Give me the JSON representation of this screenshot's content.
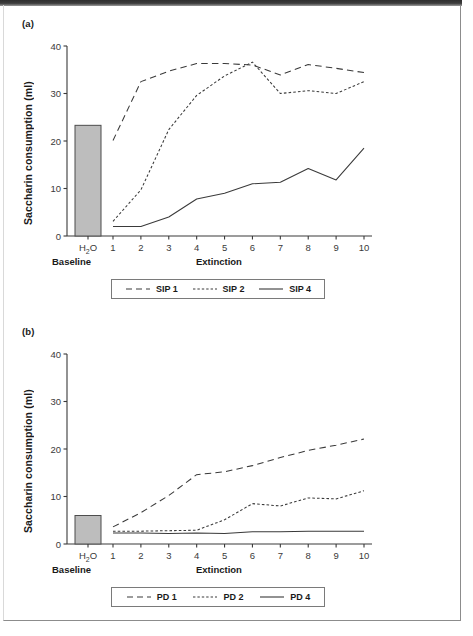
{
  "figure": {
    "panels": [
      {
        "tag": "(a)",
        "ylabel": "Saccharin consumption (ml)",
        "baseline_group_label": "Baseline",
        "extinction_group_label": "Extinction",
        "baseline_tick_label": "H2O",
        "legend": [
          {
            "label": "SIP 1",
            "style": "long-dash"
          },
          {
            "label": "SIP 2",
            "style": "short-dash"
          },
          {
            "label": "SIP 4",
            "style": "solid"
          }
        ]
      },
      {
        "tag": "(b)",
        "ylabel": "Saccharin consumption (ml)",
        "baseline_group_label": "Baseline",
        "extinction_group_label": "Extinction",
        "baseline_tick_label": "H2O",
        "legend": [
          {
            "label": "PD 1",
            "style": "long-dash"
          },
          {
            "label": "PD 2",
            "style": "short-dash"
          },
          {
            "label": "PD 4",
            "style": "solid"
          }
        ]
      }
    ]
  },
  "chart_data": [
    {
      "type": "line",
      "panel": "(a)",
      "title": "",
      "xlabel": "Extinction",
      "ylabel": "Saccharin consumption (ml)",
      "ylim": [
        0,
        40
      ],
      "yticks": [
        0,
        10,
        20,
        30,
        40
      ],
      "ytick_labels": [
        "0",
        "10",
        "20",
        "30",
        "40"
      ],
      "grid": false,
      "legend_position": "below",
      "baseline": {
        "category": "H2O",
        "group_label": "Baseline",
        "value": 23.3,
        "bar_color": "#bdbdbd",
        "bar_edge_color": "#4d4d4d"
      },
      "categories": [
        "1",
        "2",
        "3",
        "4",
        "5",
        "6",
        "7",
        "8",
        "9",
        "10"
      ],
      "x": [
        1,
        2,
        3,
        4,
        5,
        6,
        7,
        8,
        9,
        10
      ],
      "series": [
        {
          "name": "SIP 1",
          "style": "long-dash",
          "values": [
            20.1,
            32.5,
            34.7,
            36.3,
            36.3,
            36.0,
            33.9,
            36.1,
            35.3,
            34.4
          ]
        },
        {
          "name": "SIP 2",
          "style": "short-dash",
          "values": [
            3.1,
            9.7,
            22.4,
            29.6,
            33.7,
            36.6,
            30.0,
            30.6,
            30.0,
            32.5
          ]
        },
        {
          "name": "SIP 4",
          "style": "solid",
          "values": [
            2.0,
            2.0,
            4.0,
            7.8,
            9.0,
            11.0,
            11.3,
            14.2,
            11.8,
            18.5
          ]
        }
      ]
    },
    {
      "type": "line",
      "panel": "(b)",
      "title": "",
      "xlabel": "Extinction",
      "ylabel": "Saccharin consumption (ml)",
      "ylim": [
        0,
        40
      ],
      "yticks": [
        0,
        10,
        20,
        30,
        40
      ],
      "ytick_labels": [
        "0",
        "10",
        "20",
        "30",
        "40"
      ],
      "grid": false,
      "legend_position": "below",
      "baseline": {
        "category": "H2O",
        "group_label": "Baseline",
        "value": 6.0,
        "bar_color": "#bdbdbd",
        "bar_edge_color": "#4d4d4d"
      },
      "categories": [
        "1",
        "2",
        "3",
        "4",
        "5",
        "6",
        "7",
        "8",
        "9",
        "10"
      ],
      "x": [
        1,
        2,
        3,
        4,
        5,
        6,
        7,
        8,
        9,
        10
      ],
      "series": [
        {
          "name": "PD 1",
          "style": "long-dash",
          "values": [
            3.6,
            6.6,
            10.2,
            14.6,
            15.2,
            16.5,
            18.2,
            19.7,
            20.8,
            22.1
          ]
        },
        {
          "name": "PD 2",
          "style": "short-dash",
          "values": [
            2.7,
            2.7,
            2.8,
            2.9,
            5.1,
            8.5,
            8.0,
            9.7,
            9.5,
            11.2
          ]
        },
        {
          "name": "PD 4",
          "style": "solid",
          "values": [
            2.3,
            2.3,
            2.2,
            2.3,
            2.2,
            2.6,
            2.6,
            2.7,
            2.7,
            2.7
          ]
        }
      ]
    }
  ]
}
